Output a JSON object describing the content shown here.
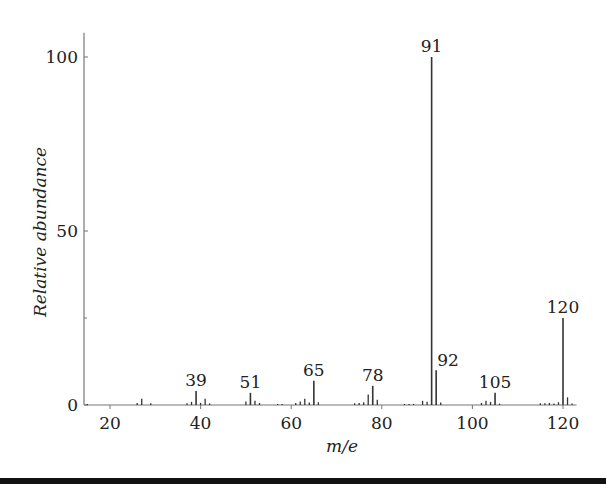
{
  "chart_data": {
    "type": "bar",
    "title": "",
    "xlabel": "m/e",
    "ylabel": "Relative abundance",
    "xlim": [
      14,
      123
    ],
    "ylim": [
      0,
      107
    ],
    "x_ticks": [
      20,
      40,
      60,
      80,
      100,
      120
    ],
    "y_ticks": [
      0,
      50,
      100
    ],
    "grid": false,
    "labeled_peaks": [
      {
        "mz": 39,
        "abundance": 4,
        "label": "39"
      },
      {
        "mz": 51,
        "abundance": 3.5,
        "label": "51"
      },
      {
        "mz": 65,
        "abundance": 7,
        "label": "65"
      },
      {
        "mz": 78,
        "abundance": 5.5,
        "label": "78"
      },
      {
        "mz": 91,
        "abundance": 100,
        "label": "91"
      },
      {
        "mz": 92,
        "abundance": 10,
        "label": "92"
      },
      {
        "mz": 105,
        "abundance": 3.5,
        "label": "105"
      },
      {
        "mz": 120,
        "abundance": 25,
        "label": "120"
      }
    ],
    "minor_peaks": [
      {
        "mz": 15,
        "abundance": 0.3
      },
      {
        "mz": 26,
        "abundance": 0.6
      },
      {
        "mz": 27,
        "abundance": 1.8
      },
      {
        "mz": 29,
        "abundance": 0.5
      },
      {
        "mz": 37,
        "abundance": 0.5
      },
      {
        "mz": 38,
        "abundance": 0.9
      },
      {
        "mz": 40,
        "abundance": 0.6
      },
      {
        "mz": 41,
        "abundance": 1.8
      },
      {
        "mz": 42,
        "abundance": 0.4
      },
      {
        "mz": 50,
        "abundance": 1.0
      },
      {
        "mz": 52,
        "abundance": 1.2
      },
      {
        "mz": 53,
        "abundance": 0.6
      },
      {
        "mz": 57,
        "abundance": 0.3
      },
      {
        "mz": 58,
        "abundance": 0.3
      },
      {
        "mz": 61,
        "abundance": 0.6
      },
      {
        "mz": 62,
        "abundance": 1.0
      },
      {
        "mz": 63,
        "abundance": 1.8
      },
      {
        "mz": 64,
        "abundance": 0.7
      },
      {
        "mz": 66,
        "abundance": 0.8
      },
      {
        "mz": 74,
        "abundance": 0.5
      },
      {
        "mz": 75,
        "abundance": 0.6
      },
      {
        "mz": 76,
        "abundance": 0.8
      },
      {
        "mz": 77,
        "abundance": 3.0
      },
      {
        "mz": 79,
        "abundance": 1.5
      },
      {
        "mz": 85,
        "abundance": 0.3
      },
      {
        "mz": 86,
        "abundance": 0.3
      },
      {
        "mz": 87,
        "abundance": 0.3
      },
      {
        "mz": 89,
        "abundance": 1.2
      },
      {
        "mz": 90,
        "abundance": 0.9
      },
      {
        "mz": 93,
        "abundance": 0.7
      },
      {
        "mz": 102,
        "abundance": 0.6
      },
      {
        "mz": 103,
        "abundance": 1.2
      },
      {
        "mz": 104,
        "abundance": 0.9
      },
      {
        "mz": 106,
        "abundance": 0.4
      },
      {
        "mz": 115,
        "abundance": 0.5
      },
      {
        "mz": 116,
        "abundance": 0.5
      },
      {
        "mz": 117,
        "abundance": 0.6
      },
      {
        "mz": 118,
        "abundance": 0.4
      },
      {
        "mz": 119,
        "abundance": 0.8
      },
      {
        "mz": 121,
        "abundance": 2.2
      },
      {
        "mz": 122,
        "abundance": 0.4
      }
    ]
  },
  "colors": {
    "axis": "#777777",
    "peak": "#333333",
    "text": "#222222",
    "bottom_bar": "#111111"
  }
}
